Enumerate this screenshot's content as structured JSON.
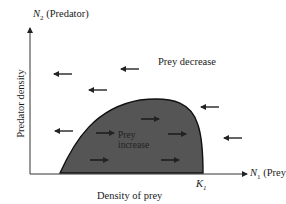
{
  "diagram": {
    "y_axis_top_label": {
      "var": "N",
      "sub": "2",
      "text": "(Predator)"
    },
    "x_axis_right_label": {
      "var": "N",
      "sub": "1",
      "text": "(Prey)"
    },
    "y_axis_title": "Predator density",
    "x_axis_title": "Density of prey",
    "k_marker": {
      "var": "K",
      "sub": "1"
    },
    "region_outside_label": "Prey decrease",
    "region_inside_label_line1": "Prey",
    "region_inside_label_line2": "increase",
    "colors": {
      "shaded_region": "#555555",
      "outline": "#111111",
      "axis": "#333333",
      "background": "#ffffff"
    },
    "arrows_outside_left": [
      {
        "x": 63,
        "y": 74
      },
      {
        "x": 130,
        "y": 69
      },
      {
        "x": 98,
        "y": 90
      },
      {
        "x": 210,
        "y": 107
      },
      {
        "x": 64,
        "y": 131
      },
      {
        "x": 233,
        "y": 138
      }
    ],
    "arrows_inside_right": [
      {
        "x": 105,
        "y": 133
      },
      {
        "x": 150,
        "y": 119
      },
      {
        "x": 177,
        "y": 134
      },
      {
        "x": 99,
        "y": 160
      },
      {
        "x": 170,
        "y": 160
      }
    ]
  }
}
